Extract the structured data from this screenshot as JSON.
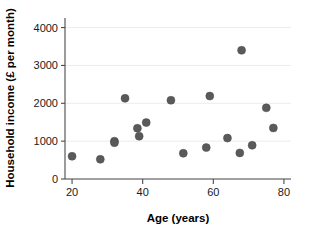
{
  "chart_data": {
    "type": "scatter",
    "title": "",
    "xlabel": "Age (years)",
    "ylabel": "Household income (£ per month)",
    "xlim": [
      18,
      82
    ],
    "ylim": [
      0,
      4200
    ],
    "xticks": [
      20,
      40,
      60,
      80
    ],
    "xtick_labels": [
      "20",
      "40",
      "60",
      "80"
    ],
    "yticks": [
      0,
      1000,
      2000,
      3000,
      4000
    ],
    "ytick_labels": [
      "0",
      "1000",
      "2000",
      "3000",
      "4000"
    ],
    "grid": true,
    "grid_axis": "y",
    "legend": false,
    "marker_color": "#5a5a5a",
    "marker_size": 4,
    "points": [
      {
        "x": 20,
        "y": 600
      },
      {
        "x": 28,
        "y": 520
      },
      {
        "x": 32,
        "y": 1000
      },
      {
        "x": 32,
        "y": 960
      },
      {
        "x": 35,
        "y": 2130
      },
      {
        "x": 38.5,
        "y": 1340
      },
      {
        "x": 39,
        "y": 1130
      },
      {
        "x": 41,
        "y": 1490
      },
      {
        "x": 48,
        "y": 2080
      },
      {
        "x": 51.5,
        "y": 680
      },
      {
        "x": 58,
        "y": 830
      },
      {
        "x": 59,
        "y": 2190
      },
      {
        "x": 64,
        "y": 1080
      },
      {
        "x": 67.5,
        "y": 690
      },
      {
        "x": 68,
        "y": 3400
      },
      {
        "x": 71,
        "y": 890
      },
      {
        "x": 75,
        "y": 1880
      },
      {
        "x": 77,
        "y": 1350
      }
    ]
  },
  "axes": {
    "x_title": "Age (years)",
    "y_title": "Household income (£ per month)"
  }
}
